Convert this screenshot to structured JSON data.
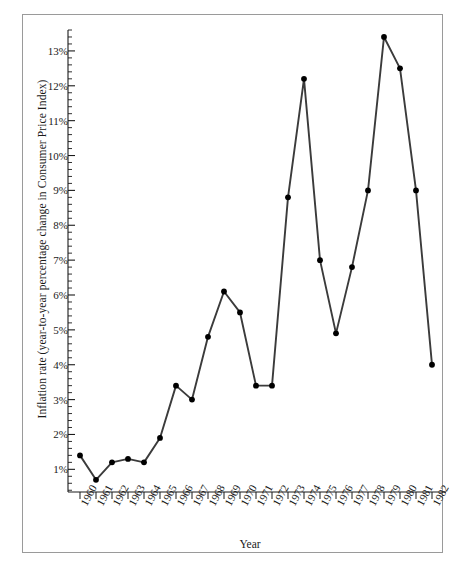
{
  "chart_data": {
    "type": "line",
    "title": "",
    "xlabel": "Year",
    "ylabel": "Inflation rate (year-to-year percentage change in Consumer Price Index)",
    "categories": [
      "1960",
      "1961",
      "1962",
      "1963",
      "1964",
      "1965",
      "1966",
      "1967",
      "1968",
      "1969",
      "1970",
      "1971",
      "1972",
      "1973",
      "1974",
      "1975",
      "1976",
      "1977",
      "1978",
      "1979",
      "1980",
      "1981",
      "1982"
    ],
    "values": [
      1.4,
      0.7,
      1.2,
      1.3,
      1.2,
      1.9,
      3.4,
      3.0,
      4.8,
      6.1,
      5.5,
      3.4,
      3.4,
      8.8,
      12.2,
      7.0,
      4.9,
      6.8,
      9.0,
      13.4,
      12.5,
      9.0,
      4.0
    ],
    "ytick_labels": [
      "13%",
      "12%",
      "11%",
      "10%",
      "9%",
      "8%",
      "7%",
      "6%",
      "5%",
      "4%",
      "3%",
      "2%",
      "1%"
    ],
    "ytick_values": [
      13,
      12,
      11,
      10,
      9,
      8,
      7,
      6,
      5,
      4,
      3,
      2,
      1
    ],
    "ylim": [
      0.35,
      13.6
    ],
    "xlim": [
      "1960",
      "1982"
    ],
    "minor_tick_step": 0.2,
    "grid": false,
    "legend": "none",
    "marker": "filled-circle",
    "line_color": "#3b3b3b",
    "marker_color": "#000000"
  }
}
